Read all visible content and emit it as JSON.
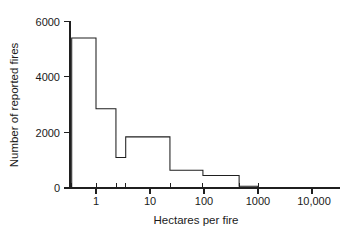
{
  "chart_data": {
    "type": "bar",
    "title": "",
    "subtitle": "",
    "xlabel": "Hectares per fire",
    "ylabel": "Number of reported fires",
    "xscale": "log",
    "yscale": "linear",
    "xlim": [
      0.355,
      3981
    ],
    "ylim": [
      0,
      6000
    ],
    "grid": false,
    "legend": null,
    "x_tick_labels": [
      "1",
      "10",
      "100",
      "1000",
      "10,000"
    ],
    "x_tick_values": [
      1,
      10,
      100,
      1000,
      10000
    ],
    "y_tick_labels": [
      "0",
      "2000",
      "4000",
      "6000"
    ],
    "y_tick_values": [
      0,
      2000,
      4000,
      6000
    ],
    "bin_edges": [
      0.355,
      1.0,
      2.34,
      3.55,
      23.4,
      95.5,
      447,
      1000,
      3981
    ],
    "bin_edges_log10": [
      -0.45,
      0.0,
      0.37,
      0.55,
      1.37,
      1.98,
      2.65,
      3.0,
      3.6
    ],
    "values": [
      5400,
      2850,
      1100,
      1840,
      640,
      450,
      60,
      20
    ],
    "bars": [
      {
        "label": "0.36-1",
        "left": 0.355,
        "right": 1.0,
        "value": 5400
      },
      {
        "label": "1-2.3",
        "left": 1.0,
        "right": 2.34,
        "value": 2850
      },
      {
        "label": "2.3-3.5",
        "left": 2.34,
        "right": 3.55,
        "value": 1100
      },
      {
        "label": "3.5-23",
        "left": 3.55,
        "right": 23.4,
        "value": 1840
      },
      {
        "label": "23-96",
        "left": 23.4,
        "right": 95.5,
        "value": 640
      },
      {
        "label": "96-447",
        "left": 95.5,
        "right": 447,
        "value": 450
      },
      {
        "label": "447-1000",
        "left": 447,
        "right": 1000,
        "value": 60
      },
      {
        "label": "1000-3981",
        "left": 1000,
        "right": 3981,
        "value": 20
      }
    ],
    "colors": {
      "axis": "#1f1f1f",
      "bar_edge": "#1f1f1f",
      "bar_fill": "#ffffff",
      "background": "#ffffff",
      "text": "#1a1a1a"
    }
  },
  "axes": {
    "y_title": "Number of reported fires",
    "x_title": "Hectares per fire",
    "y_ticks": [
      {
        "label": "6000",
        "value": 6000
      },
      {
        "label": "4000",
        "value": 4000
      },
      {
        "label": "2000",
        "value": 2000
      },
      {
        "label": "0",
        "value": 0
      }
    ],
    "x_ticks": [
      {
        "label": "1",
        "value": 1
      },
      {
        "label": "10",
        "value": 10
      },
      {
        "label": "100",
        "value": 100
      },
      {
        "label": "1000",
        "value": 1000
      },
      {
        "label": "10,000",
        "value": 10000
      }
    ]
  }
}
